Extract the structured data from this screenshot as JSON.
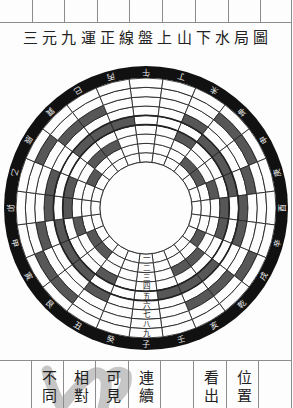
{
  "page": {
    "title": "三元九運正線盤上山下水局圖",
    "bottom_columns": [
      {
        "text": ""
      },
      {
        "text": "不同"
      },
      {
        "text": "相對"
      },
      {
        "text": "可見"
      },
      {
        "text": "連續"
      },
      {
        "text": ""
      },
      {
        "text": "看出"
      },
      {
        "text": "位置"
      },
      {
        "text": ""
      }
    ]
  },
  "diagram": {
    "type": "concentric-ring-sector-diagram",
    "orientation": "south-at-top",
    "mountains": [
      "午",
      "丁",
      "未",
      "坤",
      "申",
      "庚",
      "酉",
      "辛",
      "戌",
      "乾",
      "亥",
      "壬",
      "子",
      "癸",
      "丑",
      "艮",
      "寅",
      "甲",
      "卯",
      "乙",
      "辰",
      "巽",
      "巳",
      "丙"
    ],
    "period_labels": [
      "一",
      "二",
      "三",
      "四",
      "五",
      "六",
      "七",
      "八",
      "九"
    ],
    "period_label_sector": "子",
    "shaded_cells_by_period": {
      "一": [],
      "二": [
        "坤",
        "申",
        "艮",
        "寅",
        "辰",
        "戌"
      ],
      "三": [
        "甲",
        "庚",
        "巽",
        "巳",
        "乾",
        "亥"
      ],
      "四": [
        "未",
        "丑",
        "卯",
        "乙",
        "酉",
        "辛"
      ],
      "五": [
        "壬",
        "丙",
        "坤",
        "申",
        "艮",
        "寅",
        "甲",
        "庚",
        "巽",
        "巳",
        "乾",
        "亥"
      ],
      "六": [
        "未",
        "丑",
        "卯",
        "乙",
        "酉",
        "辛"
      ],
      "七": [
        "甲",
        "庚",
        "巽",
        "巳",
        "乾",
        "亥"
      ],
      "八": [
        "坤",
        "申",
        "艮",
        "寅",
        "辰",
        "戌"
      ],
      "九": []
    },
    "colors": {
      "ring": "#111111",
      "ring_text": "#ececec",
      "shade": "#575757",
      "line": "#222222",
      "paper": "#fdfdfd",
      "label": "#111111"
    }
  }
}
